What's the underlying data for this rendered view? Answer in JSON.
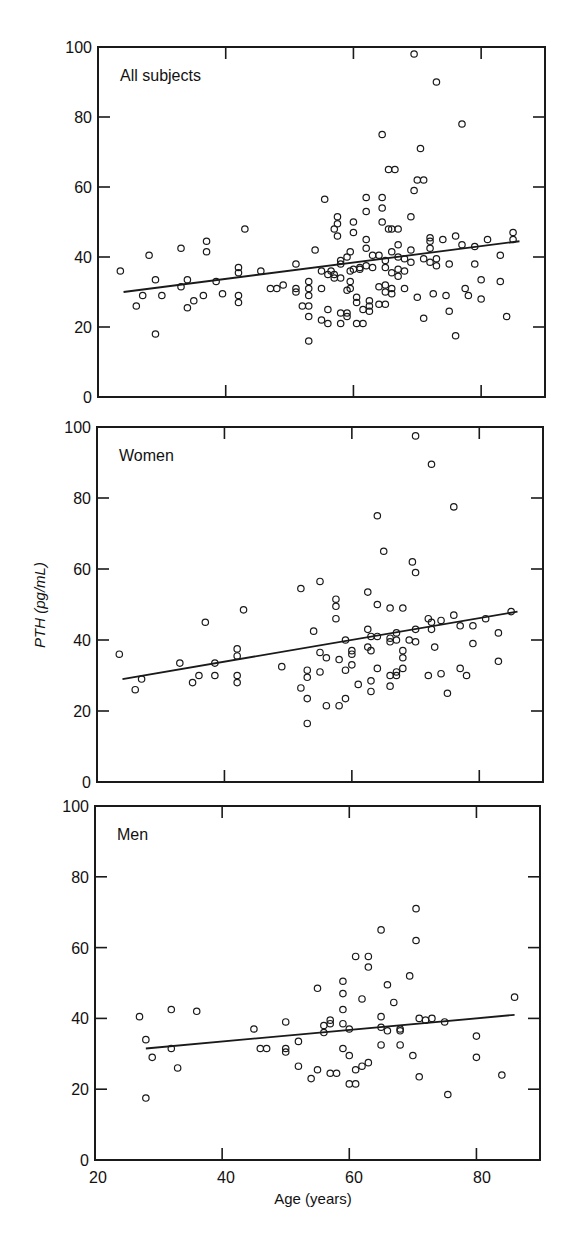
{
  "chart_data": [
    {
      "type": "scatter",
      "title": "All subjects",
      "xlabel": "",
      "ylabel": "PTH (pg/mL)",
      "xlim": [
        20,
        90
      ],
      "ylim": [
        0,
        100
      ],
      "x_ticks": [
        20,
        40,
        60,
        80
      ],
      "y_ticks": [
        0,
        20,
        40,
        60,
        80,
        100
      ],
      "grid": false,
      "legend": null,
      "regression_line": {
        "x": [
          24,
          86
        ],
        "y": [
          30,
          44.5
        ]
      },
      "points": [
        [
          23.5,
          36
        ],
        [
          26,
          26
        ],
        [
          27,
          29
        ],
        [
          28,
          40.5
        ],
        [
          29,
          18
        ],
        [
          29,
          33.5
        ],
        [
          30,
          29
        ],
        [
          33,
          31.5
        ],
        [
          33,
          42.5
        ],
        [
          34,
          33.5
        ],
        [
          34,
          25.5
        ],
        [
          35,
          27.5
        ],
        [
          36.5,
          29
        ],
        [
          37,
          41.5
        ],
        [
          37,
          44.5
        ],
        [
          38.5,
          33
        ],
        [
          39.5,
          29.5
        ],
        [
          42,
          37
        ],
        [
          42,
          35.5
        ],
        [
          42,
          29
        ],
        [
          42,
          27
        ],
        [
          43,
          48
        ],
        [
          45.5,
          36
        ],
        [
          47,
          31
        ],
        [
          48,
          31
        ],
        [
          49,
          32
        ],
        [
          51,
          38
        ],
        [
          51,
          31
        ],
        [
          51,
          30
        ],
        [
          52,
          26
        ],
        [
          53,
          26
        ],
        [
          53,
          33
        ],
        [
          53,
          31
        ],
        [
          53,
          29
        ],
        [
          53,
          23
        ],
        [
          53,
          16
        ],
        [
          54,
          42
        ],
        [
          55,
          31
        ],
        [
          55,
          36
        ],
        [
          55,
          22
        ],
        [
          55.5,
          56.5
        ],
        [
          56,
          25
        ],
        [
          56,
          35
        ],
        [
          56,
          21
        ],
        [
          56.5,
          36
        ],
        [
          57,
          48
        ],
        [
          57,
          35
        ],
        [
          57,
          34
        ],
        [
          57.5,
          51.5
        ],
        [
          57.5,
          49.5
        ],
        [
          57.5,
          46
        ],
        [
          58,
          39
        ],
        [
          58,
          38
        ],
        [
          58,
          34
        ],
        [
          58,
          24
        ],
        [
          58,
          21
        ],
        [
          59,
          30.5
        ],
        [
          59,
          24
        ],
        [
          59,
          23
        ],
        [
          59,
          40
        ],
        [
          59.5,
          31
        ],
        [
          59.5,
          33
        ],
        [
          59.5,
          36
        ],
        [
          59.5,
          41.5
        ],
        [
          60,
          36.5
        ],
        [
          60,
          47
        ],
        [
          60,
          50
        ],
        [
          60.5,
          21
        ],
        [
          60.5,
          27
        ],
        [
          60.5,
          28.5
        ],
        [
          61,
          37
        ],
        [
          61,
          36.5
        ],
        [
          61.5,
          25
        ],
        [
          61.5,
          21
        ],
        [
          62,
          45
        ],
        [
          62,
          37.5
        ],
        [
          62,
          42.5
        ],
        [
          62,
          57
        ],
        [
          62,
          53
        ],
        [
          62.5,
          27.5
        ],
        [
          62.5,
          26
        ],
        [
          62.5,
          24.5
        ],
        [
          63,
          37
        ],
        [
          63,
          40.5
        ],
        [
          64,
          40.5
        ],
        [
          64,
          31.5
        ],
        [
          64,
          26.5
        ],
        [
          64.5,
          50
        ],
        [
          64.5,
          54
        ],
        [
          64.5,
          57
        ],
        [
          64.5,
          75
        ],
        [
          65,
          39
        ],
        [
          65,
          37
        ],
        [
          65,
          32
        ],
        [
          65,
          30
        ],
        [
          65,
          26.5
        ],
        [
          65.5,
          48
        ],
        [
          65.5,
          65
        ],
        [
          66,
          48
        ],
        [
          66,
          35.5
        ],
        [
          66,
          31
        ],
        [
          66,
          29.5
        ],
        [
          66,
          41.5
        ],
        [
          66.5,
          65
        ],
        [
          67,
          43.5
        ],
        [
          67,
          36.5
        ],
        [
          67,
          34.5
        ],
        [
          67,
          48
        ],
        [
          67,
          40
        ],
        [
          68,
          36
        ],
        [
          68,
          31
        ],
        [
          68,
          39.5
        ],
        [
          69,
          42
        ],
        [
          69,
          38.5
        ],
        [
          69,
          51.5
        ],
        [
          69.5,
          59
        ],
        [
          69.5,
          98
        ],
        [
          70,
          28.5
        ],
        [
          70,
          62
        ],
        [
          70.5,
          71
        ],
        [
          71,
          62
        ],
        [
          71,
          39.5
        ],
        [
          71,
          22.5
        ],
        [
          72,
          45.5
        ],
        [
          72,
          42.5
        ],
        [
          72,
          44.5
        ],
        [
          72,
          38.5
        ],
        [
          72.5,
          29.5
        ],
        [
          73,
          39.5
        ],
        [
          73,
          37.5
        ],
        [
          73,
          90
        ],
        [
          74,
          45
        ],
        [
          74.5,
          29
        ],
        [
          75,
          38
        ],
        [
          75,
          24.5
        ],
        [
          76,
          46
        ],
        [
          76,
          17.5
        ],
        [
          77,
          43.5
        ],
        [
          77,
          78
        ],
        [
          77.5,
          31
        ],
        [
          78,
          29
        ],
        [
          79,
          43
        ],
        [
          79,
          38
        ],
        [
          80,
          33.5
        ],
        [
          80,
          28
        ],
        [
          81,
          45
        ],
        [
          83,
          40.5
        ],
        [
          83,
          33
        ],
        [
          84,
          23
        ],
        [
          85,
          47
        ],
        [
          85,
          45
        ]
      ]
    },
    {
      "type": "scatter",
      "title": "Women",
      "xlabel": "",
      "ylabel": "PTH (pg/mL)",
      "xlim": [
        20,
        90
      ],
      "ylim": [
        0,
        100
      ],
      "x_ticks": [
        20,
        40,
        60,
        80
      ],
      "y_ticks": [
        0,
        20,
        40,
        60,
        80,
        100
      ],
      "grid": false,
      "legend": null,
      "regression_line": {
        "x": [
          24,
          86
        ],
        "y": [
          29,
          48
        ]
      },
      "points": [
        [
          23.5,
          36
        ],
        [
          26,
          26
        ],
        [
          27,
          29
        ],
        [
          33,
          33.5
        ],
        [
          35,
          28
        ],
        [
          36,
          30
        ],
        [
          37,
          45
        ],
        [
          38.5,
          33.5
        ],
        [
          38.5,
          30
        ],
        [
          42,
          37.5
        ],
        [
          42,
          35.5
        ],
        [
          42,
          30
        ],
        [
          42,
          28
        ],
        [
          43,
          48.5
        ],
        [
          49,
          32.5
        ],
        [
          52,
          26.5
        ],
        [
          52,
          54.5
        ],
        [
          53,
          31.5
        ],
        [
          53,
          29.5
        ],
        [
          53,
          23.5
        ],
        [
          53,
          16.5
        ],
        [
          54,
          42.5
        ],
        [
          55,
          36.5
        ],
        [
          55,
          31
        ],
        [
          55,
          56.5
        ],
        [
          56,
          35
        ],
        [
          56,
          21.5
        ],
        [
          57.5,
          51.5
        ],
        [
          57.5,
          49.5
        ],
        [
          57.5,
          46
        ],
        [
          58,
          34.5
        ],
        [
          58,
          21.5
        ],
        [
          59,
          40
        ],
        [
          59,
          31.5
        ],
        [
          59,
          23.5
        ],
        [
          60,
          37
        ],
        [
          60,
          36
        ],
        [
          60,
          33
        ],
        [
          61,
          27.5
        ],
        [
          62.5,
          53.5
        ],
        [
          62.5,
          43
        ],
        [
          62.5,
          38
        ],
        [
          63,
          41
        ],
        [
          63,
          37
        ],
        [
          63,
          28.5
        ],
        [
          63,
          25.5
        ],
        [
          64,
          50
        ],
        [
          64,
          41
        ],
        [
          64,
          32
        ],
        [
          64,
          75
        ],
        [
          65,
          65
        ],
        [
          66,
          49
        ],
        [
          66,
          40.5
        ],
        [
          66,
          39.5
        ],
        [
          66,
          30
        ],
        [
          66,
          27
        ],
        [
          67,
          42
        ],
        [
          67,
          40
        ],
        [
          67,
          31
        ],
        [
          67,
          30
        ],
        [
          68,
          49
        ],
        [
          68,
          37
        ],
        [
          68,
          35
        ],
        [
          68,
          32
        ],
        [
          69,
          40
        ],
        [
          69.5,
          62
        ],
        [
          70,
          43
        ],
        [
          70,
          39.5
        ],
        [
          70,
          59
        ],
        [
          70,
          97.5
        ],
        [
          72,
          46
        ],
        [
          72,
          30
        ],
        [
          72.5,
          45
        ],
        [
          72.5,
          43
        ],
        [
          72.5,
          89.5
        ],
        [
          73,
          38
        ],
        [
          74,
          45.5
        ],
        [
          74,
          30.5
        ],
        [
          75,
          25
        ],
        [
          76,
          47
        ],
        [
          76,
          77.5
        ],
        [
          77,
          44
        ],
        [
          77,
          32
        ],
        [
          78,
          30
        ],
        [
          79,
          44
        ],
        [
          79,
          39
        ],
        [
          81,
          46
        ],
        [
          83,
          42
        ],
        [
          83,
          34
        ],
        [
          85,
          48
        ]
      ]
    },
    {
      "type": "scatter",
      "title": "Men",
      "xlabel": "Age (years)",
      "ylabel": "PTH (pg/mL)",
      "xlim": [
        20,
        90
      ],
      "ylim": [
        0,
        100
      ],
      "x_ticks": [
        20,
        40,
        60,
        80
      ],
      "y_ticks": [
        0,
        20,
        40,
        60,
        80,
        100
      ],
      "grid": false,
      "legend": null,
      "regression_line": {
        "x": [
          28,
          86
        ],
        "y": [
          31.5,
          41
        ]
      },
      "points": [
        [
          27,
          40.5
        ],
        [
          28,
          34
        ],
        [
          28,
          17.5
        ],
        [
          29,
          29
        ],
        [
          32,
          31.5
        ],
        [
          32,
          42.5
        ],
        [
          33,
          26
        ],
        [
          36,
          42
        ],
        [
          45,
          37
        ],
        [
          46,
          31.5
        ],
        [
          47,
          31.5
        ],
        [
          50,
          39
        ],
        [
          50,
          31.5
        ],
        [
          50,
          30.5
        ],
        [
          52,
          33.5
        ],
        [
          52,
          26.5
        ],
        [
          54,
          23
        ],
        [
          55,
          25.5
        ],
        [
          55,
          48.5
        ],
        [
          56,
          36
        ],
        [
          56,
          38
        ],
        [
          57,
          39.5
        ],
        [
          57,
          38.5
        ],
        [
          57,
          24.5
        ],
        [
          58,
          24.5
        ],
        [
          59,
          50.5
        ],
        [
          59,
          47
        ],
        [
          59,
          42.5
        ],
        [
          59,
          38.5
        ],
        [
          59,
          31.5
        ],
        [
          60,
          37
        ],
        [
          60,
          29.5
        ],
        [
          60,
          21.5
        ],
        [
          61,
          21.5
        ],
        [
          61,
          25.5
        ],
        [
          61,
          57.5
        ],
        [
          62,
          45.5
        ],
        [
          62,
          26.5
        ],
        [
          63,
          27.5
        ],
        [
          63,
          54.5
        ],
        [
          63,
          57.5
        ],
        [
          65,
          40.5
        ],
        [
          65,
          37.5
        ],
        [
          65,
          32.5
        ],
        [
          65,
          65
        ],
        [
          66,
          49.5
        ],
        [
          66,
          36.5
        ],
        [
          67,
          44.5
        ],
        [
          68,
          37
        ],
        [
          68,
          36.5
        ],
        [
          68,
          32.5
        ],
        [
          69.5,
          52
        ],
        [
          70,
          29.5
        ],
        [
          70.5,
          71
        ],
        [
          70.5,
          62
        ],
        [
          71,
          40
        ],
        [
          71,
          23.5
        ],
        [
          72,
          39.5
        ],
        [
          73,
          40
        ],
        [
          75,
          39
        ],
        [
          75.5,
          18.5
        ],
        [
          80,
          35
        ],
        [
          80,
          29
        ],
        [
          84,
          24
        ],
        [
          86,
          46
        ]
      ]
    }
  ],
  "figure": {
    "ylabel": "PTH (pg/mL)",
    "xlabel": "Age (years)",
    "x_tick_labels": [
      "20",
      "40",
      "60",
      "80"
    ],
    "y_tick_labels": [
      "0",
      "20",
      "40",
      "60",
      "80",
      "100"
    ],
    "panels": [
      {
        "title": "All subjects"
      },
      {
        "title": "Women"
      },
      {
        "title": "Men"
      }
    ]
  }
}
